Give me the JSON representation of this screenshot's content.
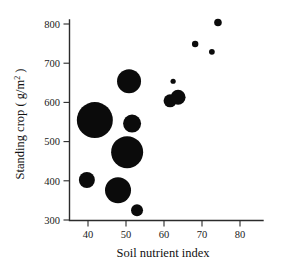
{
  "figure": {
    "name": "soil-nutrient-standing-crop-bubble-plot",
    "background_color": "#ffffff",
    "marker_color": "#0b0b0b"
  },
  "chart_data": {
    "type": "scatter",
    "title": "",
    "subtitle": "",
    "xlabel": "Soil nutrient index",
    "ylabel_parts": {
      "main": "Standing crop ( g/m",
      "superscript": "2",
      "tail": " )"
    },
    "ylabel": "Standing crop ( g/m2 )",
    "xlim": [
      35,
      87
    ],
    "ylim": [
      300,
      825
    ],
    "xticks": [
      40,
      50,
      60,
      70,
      80
    ],
    "xticklabels": [
      "40",
      "50",
      "60",
      "70",
      "80"
    ],
    "yticks": [
      300,
      400,
      500,
      600,
      700,
      800
    ],
    "yticklabels": [
      "300",
      "400",
      "500",
      "600",
      "700",
      "800"
    ],
    "grid": false,
    "legend": false,
    "legend_position": "none",
    "marker_shape": "circle",
    "marker_size_encodes": "third variable (bubble area)",
    "points": [
      {
        "label": "p1",
        "x": 39.7,
        "y": 402,
        "r_px": 8.0
      },
      {
        "label": "p2",
        "x": 41.8,
        "y": 555,
        "r_px": 18.0
      },
      {
        "label": "p3",
        "x": 47.9,
        "y": 376,
        "r_px": 13.0
      },
      {
        "label": "p4",
        "x": 50.3,
        "y": 473,
        "r_px": 16.0
      },
      {
        "label": "p5",
        "x": 50.8,
        "y": 654,
        "r_px": 12.0
      },
      {
        "label": "p6",
        "x": 51.6,
        "y": 546,
        "r_px": 9.0
      },
      {
        "label": "p7",
        "x": 52.9,
        "y": 325,
        "r_px": 6.0
      },
      {
        "label": "p8",
        "x": 61.6,
        "y": 604,
        "r_px": 6.5
      },
      {
        "label": "p9",
        "x": 62.4,
        "y": 654,
        "r_px": 2.6
      },
      {
        "label": "p10",
        "x": 63.7,
        "y": 613,
        "r_px": 7.5
      },
      {
        "label": "p11",
        "x": 68.2,
        "y": 749,
        "r_px": 3.2
      },
      {
        "label": "p12",
        "x": 72.6,
        "y": 729,
        "r_px": 2.9
      },
      {
        "label": "p13",
        "x": 74.2,
        "y": 804,
        "r_px": 3.8
      }
    ]
  },
  "axes_geometry": {
    "plot_left_px": 69,
    "plot_right_px": 263,
    "plot_top_px": 20,
    "plot_bottom_px": 220,
    "x_px_at_40": 88,
    "x_px_at_80": 240,
    "y_px_at_800": 24,
    "y_px_at_300": 220
  }
}
